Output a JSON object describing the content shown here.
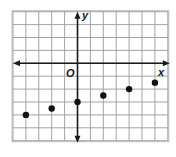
{
  "chart_data": {
    "type": "scatter",
    "title": "",
    "xlabel": "x",
    "ylabel": "y",
    "origin_label": "O",
    "xlim": [
      -5,
      7
    ],
    "ylim": [
      -6,
      4
    ],
    "grid": true,
    "grid_step": 1,
    "x": [
      -4,
      -2,
      0,
      2,
      4,
      6
    ],
    "y": [
      -4,
      -3.5,
      -3,
      -2.5,
      -2,
      -1.5
    ]
  },
  "colors": {
    "grid": "#9a9a9a",
    "axis": "#1a1a1a",
    "point": "#111111",
    "border": "#bdbdbd"
  }
}
